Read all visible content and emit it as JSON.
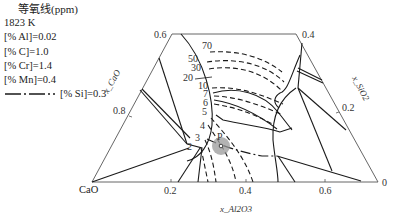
{
  "legend": {
    "title": "等氧线(ppm)",
    "conditions": [
      "1823 K",
      "[% Al]=0.02",
      "[% C]=1.0",
      "[% Cr]=1.4",
      "[% Mn]=0.4"
    ],
    "si_line_label": "[% Si]=0.3",
    "si_line_style": "dash-dot"
  },
  "diagram": {
    "type": "ternary-phase-diagram",
    "components": {
      "bottom_left": "CaO",
      "right": "SiO2",
      "top": "Al2O3"
    },
    "vertex_label": "CaO",
    "axis_titles": {
      "left": "x_CaO",
      "right": "x_SiO2",
      "bottom": "x_Al2O3"
    },
    "bottom_ticks": [
      "0.2",
      "0.4",
      "0.6"
    ],
    "left_ticks": [
      "0.8",
      "0.6"
    ],
    "right_ticks": [
      "0.4",
      "0.2",
      "0"
    ],
    "iso_oxygen_contours_ppm": [
      "70",
      "50",
      "30",
      "20",
      "10",
      "7",
      "6",
      "5",
      "4",
      "3",
      "2"
    ],
    "point_label": "P",
    "colors": {
      "line": "#1a1a1a",
      "frame": "#555555",
      "highlight": "#9a9a9a"
    }
  }
}
